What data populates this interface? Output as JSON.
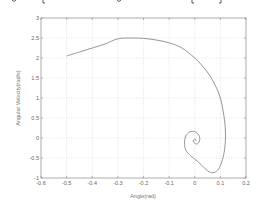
{
  "chart_data": {
    "type": "line",
    "title": "",
    "xlabel": "Angle(rad)",
    "ylabel": "Angular Velocity(rad/s)",
    "xlim": [
      -0.6,
      0.2
    ],
    "ylim": [
      -1,
      3
    ],
    "grid": true,
    "grid_style": "dotted",
    "legend": null,
    "xticks": [
      -0.6,
      -0.5,
      -0.4,
      -0.3,
      -0.2,
      -0.1,
      0,
      0.1,
      0.2
    ],
    "xtick_labels": [
      "-0.6",
      "-0.5",
      "-0.4",
      "-0.3",
      "-0.2",
      "-0.1",
      "0",
      "0.1",
      "0.2"
    ],
    "yticks": [
      3,
      2.5,
      2,
      1.5,
      1,
      0.5,
      0,
      -0.5,
      -1
    ],
    "ytick_labels": [
      "3",
      "2.5",
      "2",
      "1.5",
      "1",
      "0.5",
      "0",
      "-0.5",
      "-1"
    ],
    "series": [
      {
        "name": "phase trajectory",
        "color": "#8a8a8a",
        "x": [
          -0.5,
          -0.45,
          -0.4,
          -0.35,
          -0.3,
          -0.25,
          -0.2,
          -0.15,
          -0.1,
          -0.05,
          0.0,
          0.03,
          0.06,
          0.085,
          0.1,
          0.11,
          0.118,
          0.12,
          0.115,
          0.105,
          0.09,
          0.07,
          0.05,
          0.03,
          0.01,
          -0.015,
          -0.035,
          -0.04,
          -0.035,
          -0.02,
          0.0,
          0.015,
          0.02,
          0.015,
          0.005,
          -0.005,
          -0.005,
          0.002,
          0.006
        ],
        "y": [
          2.05,
          2.15,
          2.25,
          2.35,
          2.48,
          2.5,
          2.49,
          2.45,
          2.38,
          2.25,
          2.0,
          1.8,
          1.55,
          1.25,
          1.0,
          0.7,
          0.35,
          0.0,
          -0.35,
          -0.6,
          -0.8,
          -0.87,
          -0.82,
          -0.7,
          -0.58,
          -0.45,
          -0.3,
          -0.12,
          0.05,
          0.15,
          0.16,
          0.08,
          -0.02,
          -0.12,
          -0.15,
          -0.1,
          -0.05,
          -0.03,
          -0.07
        ]
      }
    ]
  },
  "header_fragment": {
    "note": "cut-off text descenders visible along top edge"
  }
}
